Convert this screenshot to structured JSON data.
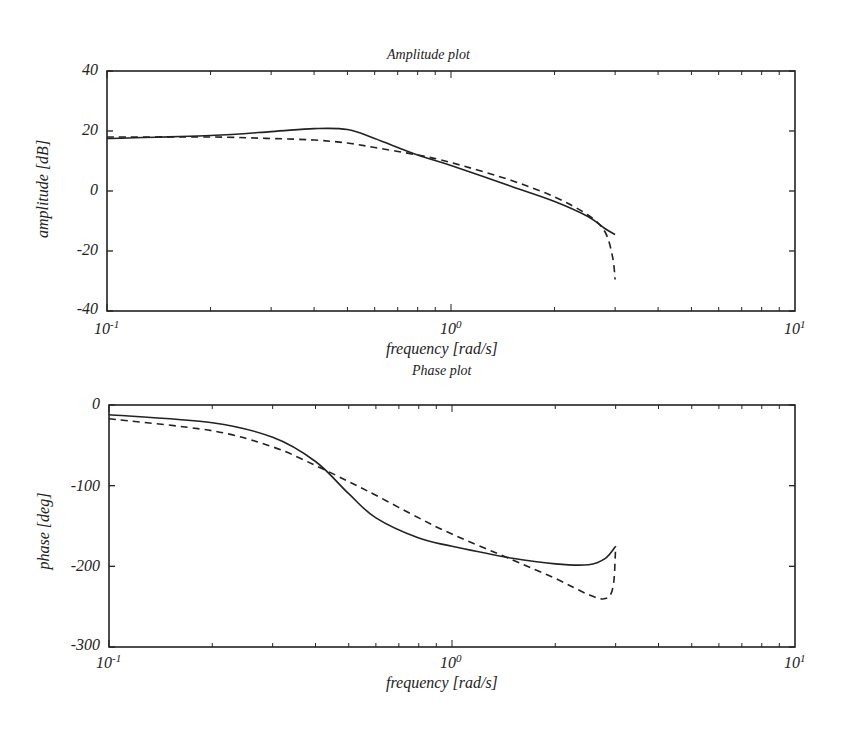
{
  "chart_data": [
    {
      "type": "line",
      "title": "Amplitude plot",
      "xlabel": "frequency [rad/s]",
      "ylabel": "amplitude [dB]",
      "xscale": "log",
      "xlim": [
        0.1,
        10
      ],
      "ylim": [
        -40,
        40
      ],
      "xticks": [
        "10^-1",
        "10^0",
        "10^1"
      ],
      "yticks": [
        40,
        20,
        0,
        -20,
        -40
      ],
      "grid": false,
      "series": [
        {
          "name": "solid",
          "style": "solid",
          "x": [
            0.1,
            0.2,
            0.3,
            0.4,
            0.5,
            0.6,
            0.8,
            1.0,
            1.5,
            2.0,
            2.5,
            2.8,
            3.0
          ],
          "y": [
            17.5,
            18.5,
            19.8,
            20.8,
            20.5,
            17.5,
            12.0,
            8.5,
            1.5,
            -3.5,
            -8.5,
            -12.5,
            -14.5
          ]
        },
        {
          "name": "dashed",
          "style": "dashed",
          "x": [
            0.1,
            0.2,
            0.3,
            0.4,
            0.5,
            0.6,
            0.8,
            1.0,
            1.5,
            2.0,
            2.5,
            2.8,
            2.95,
            3.0
          ],
          "y": [
            18.0,
            18.0,
            17.5,
            17.0,
            16.0,
            14.5,
            12.0,
            9.5,
            3.5,
            -2.0,
            -8.0,
            -13.5,
            -22.0,
            -29.5
          ]
        }
      ]
    },
    {
      "type": "line",
      "title": "Phase plot",
      "xlabel": "frequency [rad/s]",
      "ylabel": "phase [deg]",
      "xscale": "log",
      "xlim": [
        0.1,
        10
      ],
      "ylim": [
        -300,
        0
      ],
      "xticks": [
        "10^-1",
        "10^0",
        "10^1"
      ],
      "yticks": [
        0,
        -100,
        -200,
        -300
      ],
      "grid": false,
      "series": [
        {
          "name": "solid",
          "style": "solid",
          "x": [
            0.1,
            0.2,
            0.3,
            0.4,
            0.5,
            0.6,
            0.8,
            1.0,
            1.5,
            2.0,
            2.5,
            2.8,
            3.0
          ],
          "y": [
            -12,
            -22,
            -40,
            -70,
            -110,
            -140,
            -165,
            -175,
            -190,
            -197,
            -198,
            -190,
            -175
          ]
        },
        {
          "name": "dashed",
          "style": "dashed",
          "x": [
            0.1,
            0.2,
            0.3,
            0.4,
            0.5,
            0.6,
            0.8,
            1.0,
            1.5,
            2.0,
            2.5,
            2.8,
            2.95,
            3.0
          ],
          "y": [
            -17,
            -32,
            -52,
            -75,
            -95,
            -112,
            -140,
            -160,
            -192,
            -215,
            -235,
            -240,
            -225,
            -175
          ]
        }
      ]
    }
  ],
  "labels": {
    "top_title": "Amplitude plot",
    "top_ylabel": "amplitude [dB]",
    "top_xlabel": "frequency [rad/s]",
    "bot_title": "Phase plot",
    "bot_ylabel": "phase [deg]",
    "bot_xlabel": "frequency [rad/s]",
    "x_base": "10",
    "x_exp": [
      "-1",
      "0",
      "1"
    ],
    "top_yticks": [
      "40",
      "20",
      "0",
      "-20",
      "-40"
    ],
    "bot_yticks": [
      "0",
      "-100",
      "-200",
      "-300"
    ]
  }
}
